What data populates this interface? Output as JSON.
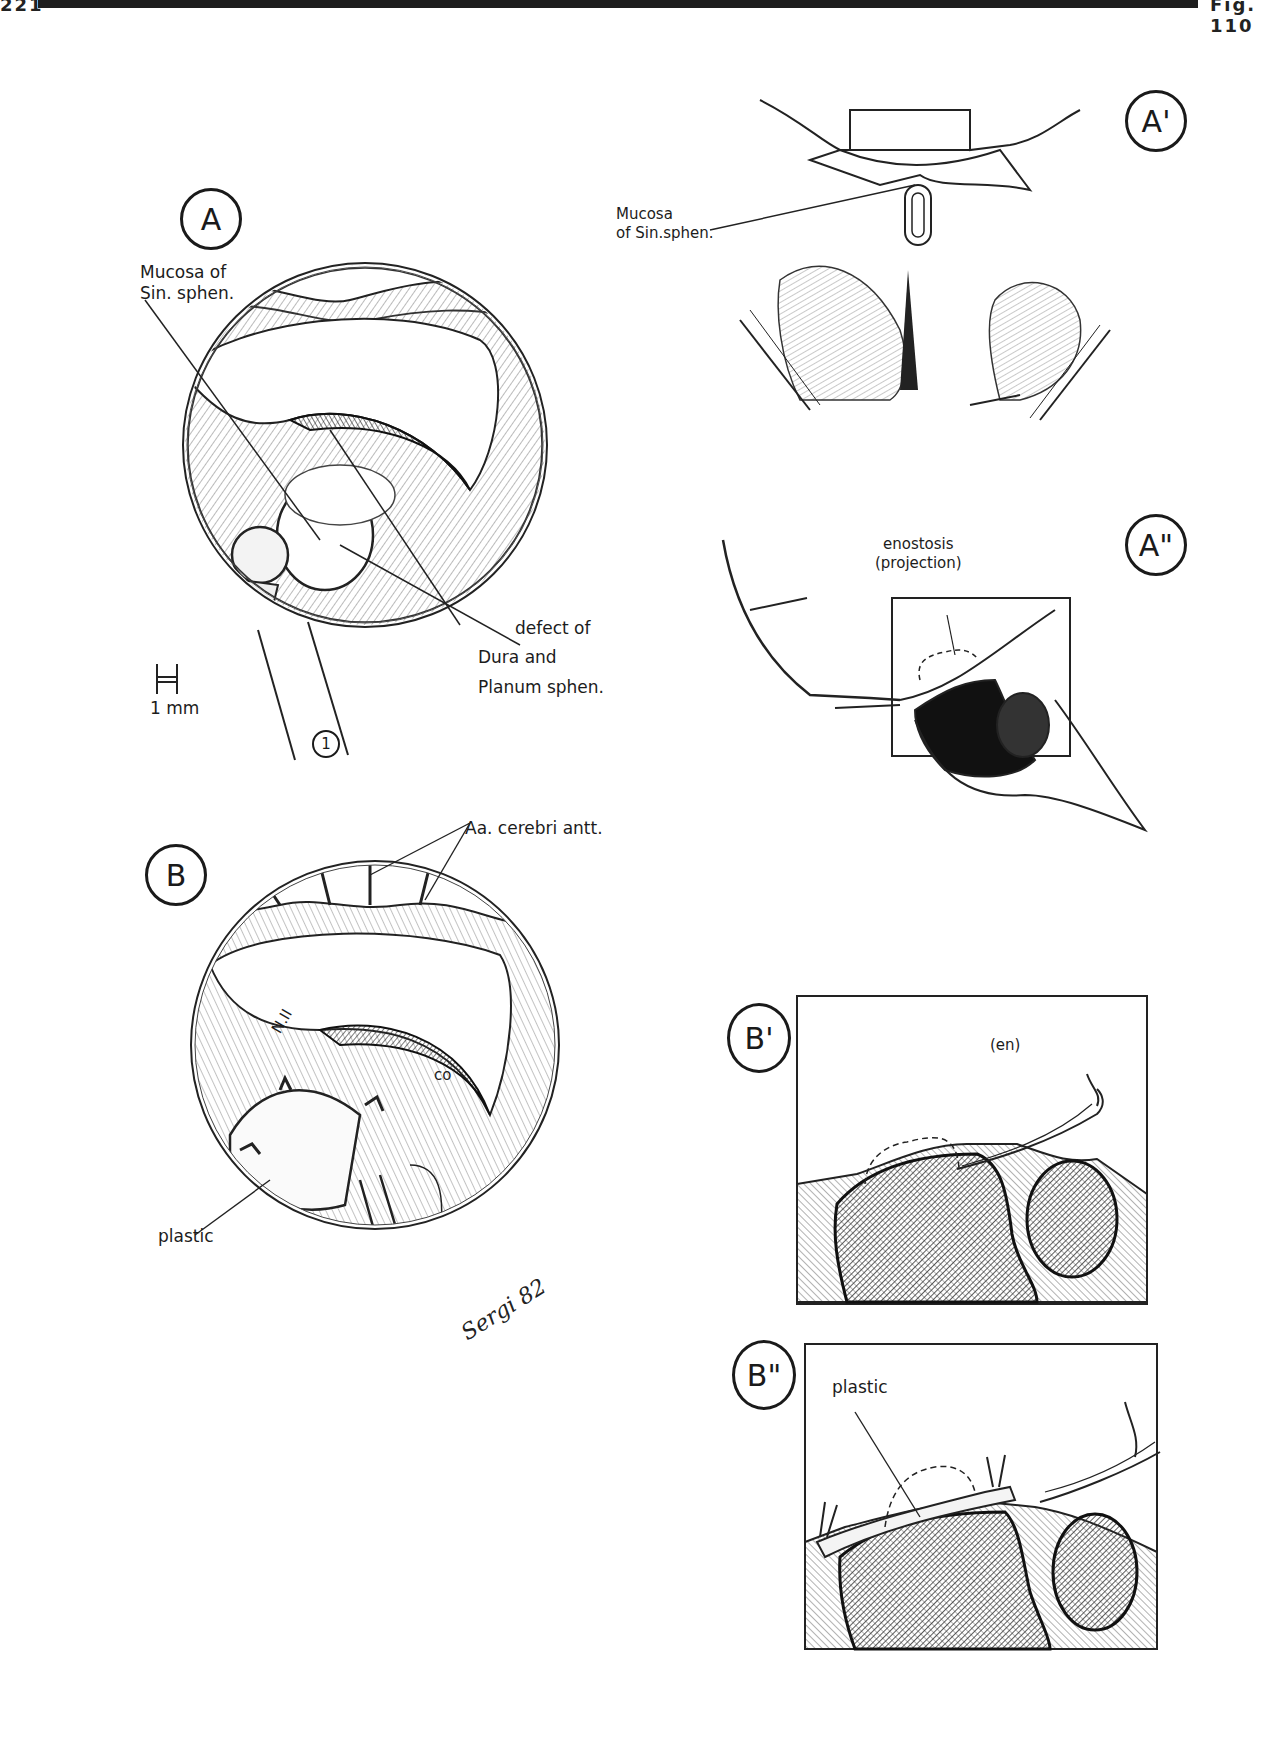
{
  "page": {
    "page_number": "221",
    "figure_ref": "Fig. 110"
  },
  "panels": {
    "A": {
      "badge": "A",
      "labels": {
        "mucosa": "Mucosa of\nSin. sphen.",
        "defect": "defect of",
        "dura": "Dura and",
        "planum": "Planum sphen.",
        "scale": "1 mm",
        "instrument_number": "1"
      }
    },
    "A_prime": {
      "badge": "A'",
      "labels": {
        "mucosa": "Mucosa\nof Sin.sphen."
      }
    },
    "A_double_prime": {
      "badge": "A\"",
      "labels": {
        "enostosis": "enostosis\n(projection)"
      }
    },
    "B": {
      "badge": "B",
      "labels": {
        "arteries": "Aa. cerebri antt.",
        "optic_nerve": "N.II",
        "chiasm": "co",
        "plastic": "plastic"
      },
      "signature": "Sergi 82"
    },
    "B_prime": {
      "badge": "B'",
      "labels": {
        "enostosis": "(en)"
      }
    },
    "B_double_prime": {
      "badge": "B\"",
      "labels": {
        "plastic": "plastic"
      }
    }
  },
  "colors": {
    "ink": "#1a1a1a",
    "paper": "#ffffff",
    "shade": "#555555"
  }
}
